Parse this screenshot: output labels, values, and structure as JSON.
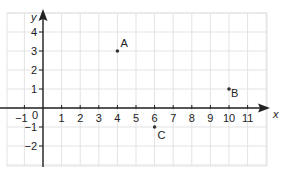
{
  "chart_data": {
    "type": "scatter",
    "title": "",
    "xlabel": "x",
    "ylabel": "y",
    "xlim": [
      -2,
      12
    ],
    "ylim": [
      -3,
      5
    ],
    "grid": true,
    "x_ticks": [
      -1,
      0,
      1,
      2,
      3,
      4,
      5,
      6,
      7,
      8,
      9,
      10,
      11
    ],
    "y_ticks": [
      -2,
      -1,
      1,
      2,
      3,
      4
    ],
    "origin_label": "0",
    "points": [
      {
        "label": "A",
        "x": 4,
        "y": 3
      },
      {
        "label": "B",
        "x": 10,
        "y": 1
      },
      {
        "label": "C",
        "x": 6,
        "y": -1
      }
    ]
  },
  "colors": {
    "grid": "#e3e3e3",
    "axis": "#222222",
    "point": "#333333"
  }
}
